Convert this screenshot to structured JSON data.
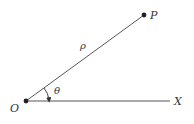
{
  "diagram": {
    "type": "polar-coordinates",
    "labels": {
      "origin": "O",
      "point": "P",
      "axis": "X",
      "radius": "ρ",
      "angle": "θ"
    },
    "colors": {
      "line": "#333333",
      "axis": "#555555",
      "text": "#333333"
    }
  }
}
